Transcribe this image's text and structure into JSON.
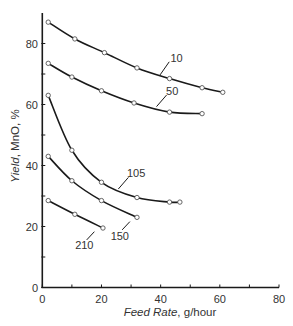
{
  "chart_data": {
    "type": "line",
    "title": "",
    "xlabel": "Feed Rate, g/hour",
    "xlabel_parts": [
      "Feed Rate",
      ", g/hour"
    ],
    "ylabel": "Yield, MnO, %",
    "ylabel_parts": [
      "Yield",
      ", MnO, %"
    ],
    "xlim": [
      0,
      80
    ],
    "ylim": [
      0,
      90
    ],
    "xticks": [
      0,
      20,
      40,
      60,
      80
    ],
    "yticks": [
      0,
      20,
      40,
      60,
      80
    ],
    "minor_xticks": [
      10,
      30,
      50,
      70
    ],
    "minor_yticks": [
      10,
      30,
      50,
      70
    ],
    "grid": false,
    "legend": null,
    "series": [
      {
        "name": "10",
        "points": [
          [
            2,
            87
          ],
          [
            11,
            81.5
          ],
          [
            21,
            77
          ],
          [
            32,
            72
          ],
          [
            43,
            68.5
          ],
          [
            54,
            65.5
          ],
          [
            61,
            64
          ]
        ],
        "label": {
          "text": "10",
          "x": 45.4,
          "y": 75.3,
          "leader": [
            [
              42.9,
              74.0
            ],
            [
              39.8,
              69.7
            ]
          ]
        }
      },
      {
        "name": "50",
        "points": [
          [
            2,
            73.5
          ],
          [
            10,
            69
          ],
          [
            20,
            64.5
          ],
          [
            31,
            60.5
          ],
          [
            43,
            57.5
          ],
          [
            54,
            57
          ]
        ],
        "label": {
          "text": "50",
          "x": 43.9,
          "y": 64.4,
          "leader": [
            [
              42.0,
              63.1
            ],
            [
              38.6,
              59.3
            ]
          ]
        }
      },
      {
        "name": "105",
        "points": [
          [
            2,
            63
          ],
          [
            10,
            45
          ],
          [
            20,
            34.5
          ],
          [
            32,
            29.5
          ],
          [
            43,
            28
          ],
          [
            46.5,
            28
          ]
        ],
        "label": {
          "text": "105",
          "x": 31.7,
          "y": 37.6,
          "leader": [
            [
              29.1,
              36.1
            ],
            [
              25.7,
              32.3
            ]
          ]
        }
      },
      {
        "name": "150",
        "points": [
          [
            2,
            43
          ],
          [
            10,
            35
          ],
          [
            20,
            28.5
          ],
          [
            32,
            23
          ]
        ],
        "label": {
          "text": "150",
          "x": 26.2,
          "y": 17.0,
          "leader": [
            [
              27.0,
              18.9
            ],
            [
              29.6,
              21.6
            ]
          ]
        }
      },
      {
        "name": "210",
        "points": [
          [
            2,
            28.5
          ],
          [
            11,
            24
          ],
          [
            20.5,
            19.5
          ]
        ],
        "label": {
          "text": "210",
          "x": 14.2,
          "y": 13.9,
          "leader": [
            [
              15.0,
              15.6
            ],
            [
              17.6,
              18.3
            ]
          ]
        }
      }
    ]
  },
  "colors": {
    "axis": "#1a1a1a",
    "curve": "#1a1a1a",
    "marker_stroke": "#555555",
    "marker_fill": "#ffffff",
    "text": "#333333"
  }
}
